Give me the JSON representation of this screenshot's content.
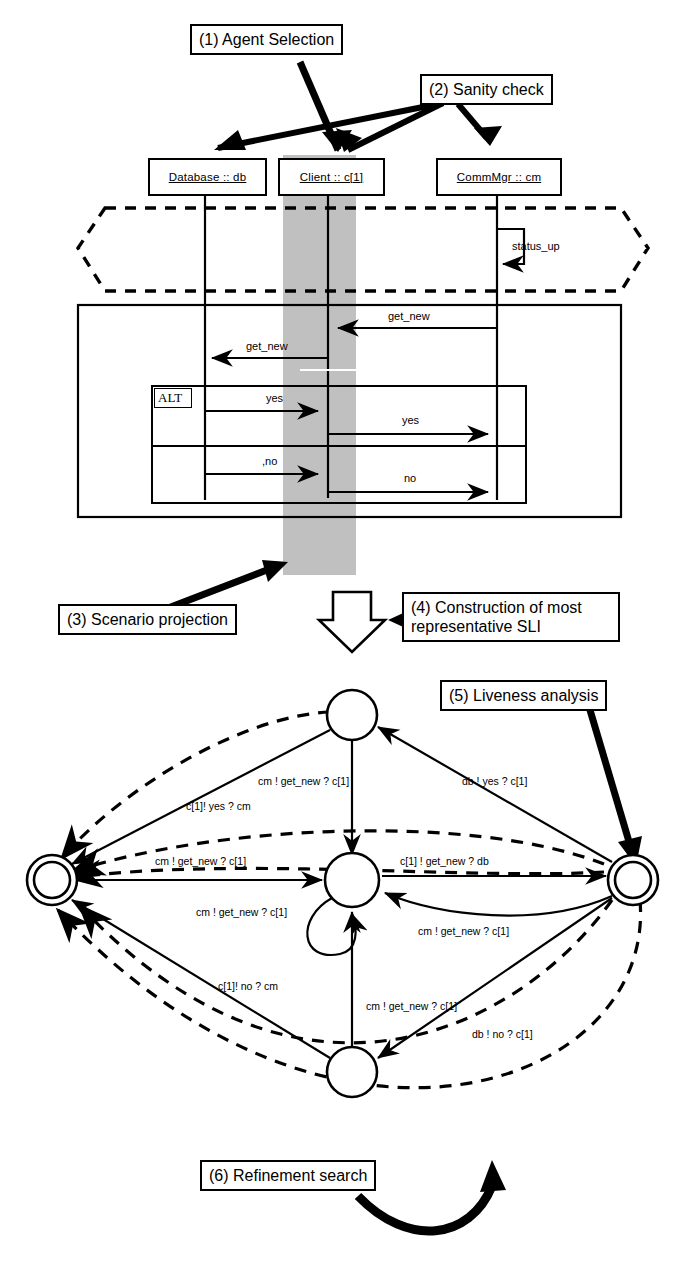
{
  "callouts": [
    {
      "id": "1",
      "label": "(1) Agent Selection"
    },
    {
      "id": "2",
      "label": "(2) Sanity check"
    },
    {
      "id": "3",
      "label": "(3) Scenario projection"
    },
    {
      "id": "4",
      "label": "(4) Construction of most\nrepresentative SLI"
    },
    {
      "id": "5",
      "label": "(5) Liveness analysis"
    },
    {
      "id": "6",
      "label": "(6) Refinement search"
    }
  ],
  "sequence_diagram": {
    "lifelines": [
      {
        "name": "database",
        "label": "Database :: db"
      },
      {
        "name": "client",
        "label": "Client :: c[1]"
      },
      {
        "name": "commmgr",
        "label": "CommMgr :: cm"
      }
    ],
    "fragment_label": "ALT",
    "messages": [
      {
        "name": "status-up",
        "label": "status_up",
        "from": "cm",
        "to": "cm",
        "kind": "self"
      },
      {
        "name": "get-new-cm-to-client",
        "label": "get_new",
        "from": "cm",
        "to": "c[1]",
        "kind": "sync"
      },
      {
        "name": "get-new-client-to-db",
        "label": "get_new",
        "from": "c[1]",
        "to": "db",
        "kind": "sync"
      },
      {
        "name": "yes-db-to-client",
        "label": "yes",
        "from": "db",
        "to": "c[1]",
        "kind": "sync"
      },
      {
        "name": "yes-client-to-cm",
        "label": "yes",
        "from": "c[1]",
        "to": "cm",
        "kind": "sync"
      },
      {
        "name": "no-db-to-client",
        "label": ",no",
        "from": "db",
        "to": "c[1]",
        "kind": "sync"
      },
      {
        "name": "no-client-to-cm",
        "label": "no",
        "from": "c[1]",
        "to": "cm",
        "kind": "sync"
      }
    ]
  },
  "automaton": {
    "states": [
      {
        "name": "state-left",
        "kind": "accepting"
      },
      {
        "name": "state-top",
        "kind": "normal"
      },
      {
        "name": "state-center",
        "kind": "normal"
      },
      {
        "name": "state-bottom",
        "kind": "normal"
      },
      {
        "name": "state-right",
        "kind": "accepting"
      }
    ],
    "transitions": [
      {
        "name": "edge-top-to-left",
        "label": "c[1]! yes ? cm"
      },
      {
        "name": "edge-top-to-center",
        "label": "cm ! get_new ? c[1]"
      },
      {
        "name": "edge-right-to-top",
        "label": "db ! yes ? c[1]"
      },
      {
        "name": "edge-left-to-center",
        "label": "cm ! get_new ? c[1]"
      },
      {
        "name": "edge-center-to-right",
        "label": "c[1] ! get_new ? db"
      },
      {
        "name": "edge-center-self",
        "label": "cm ! get_new ? c[1]"
      },
      {
        "name": "edge-right-to-center",
        "label": "cm ! get_new ? c[1]"
      },
      {
        "name": "edge-bottom-to-left",
        "label": "c[1]! no ? cm"
      },
      {
        "name": "edge-bottom-to-center",
        "label": "cm ! get_new ? c[1]"
      },
      {
        "name": "edge-right-to-bottom",
        "label": "db ! no ? c[1]"
      }
    ]
  },
  "colors": {
    "stroke": "#000000",
    "projection_band": "#c0c0c0",
    "background": "#ffffff"
  }
}
